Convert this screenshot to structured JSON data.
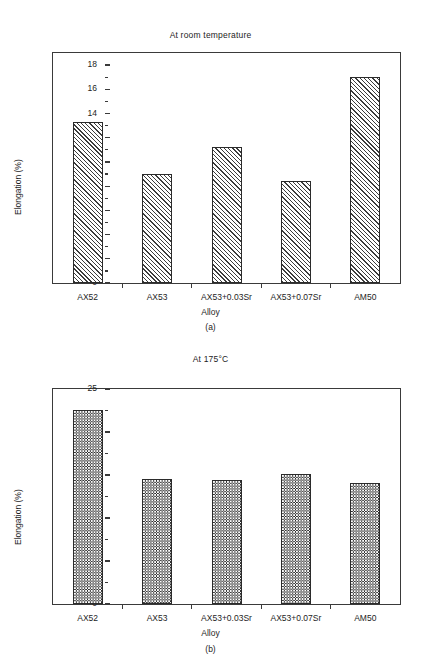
{
  "chart_data": [
    {
      "type": "bar",
      "panel": "(a)",
      "title": "At room temperature",
      "xlabel": "Alloy",
      "ylabel": "Elongation (%)",
      "categories": [
        "AX52",
        "AX53",
        "AX53+0.03Sr",
        "AX53+0.07Sr",
        "AM50"
      ],
      "values": [
        13.3,
        9.0,
        11.2,
        8.4,
        17.0
      ],
      "ylim": [
        0,
        19
      ],
      "ytick_values": [
        0,
        2,
        4,
        6,
        8,
        10,
        12,
        14,
        16,
        18
      ],
      "ytick_labels": [
        "0",
        "2",
        "4",
        "6",
        "8",
        "10",
        "12",
        "14",
        "16",
        "18"
      ],
      "yminor_values": [
        1,
        3,
        5,
        7,
        9,
        11,
        13,
        15,
        17
      ],
      "grid": false,
      "legend": "none",
      "fill_pattern": "diagonal-hatch"
    },
    {
      "type": "bar",
      "panel": "(b)",
      "title": "At 175°C",
      "xlabel": "Alloy",
      "ylabel": "Elongation (%)",
      "categories": [
        "AX52",
        "AX53",
        "AX53+0.03Sr",
        "AX53+0.07Sr",
        "AM50"
      ],
      "values": [
        22.6,
        14.5,
        14.4,
        15.1,
        14.1
      ],
      "ylim": [
        0,
        25
      ],
      "ytick_values": [
        0,
        5,
        10,
        15,
        20,
        25
      ],
      "ytick_labels": [
        "0",
        "5",
        "10",
        "15",
        "20",
        "25"
      ],
      "yminor_values": [
        2.5,
        7.5,
        12.5,
        17.5,
        22.5
      ],
      "grid": false,
      "legend": "none",
      "fill_pattern": "checkerboard"
    }
  ],
  "figure_a": {
    "title": "At room temperature",
    "ylabel": "Elongation (%)",
    "xlabel": "Alloy",
    "panel_label": "(a)",
    "ytick_labels": [
      "0",
      "2",
      "4",
      "6",
      "8",
      "10",
      "12",
      "14",
      "16",
      "18"
    ],
    "xtick_labels": [
      "AX52",
      "AX53",
      "AX53+0.03Sr",
      "AX53+0.07Sr",
      "AM50"
    ]
  },
  "figure_b": {
    "title": "At 175°C",
    "ylabel": "Elongation (%)",
    "xlabel": "Alloy",
    "panel_label": "(b)",
    "ytick_labels": [
      "0",
      "5",
      "10",
      "15",
      "20",
      "25"
    ],
    "xtick_labels": [
      "AX52",
      "AX53",
      "AX53+0.03Sr",
      "AX53+0.07Sr",
      "AM50"
    ]
  },
  "colors": {
    "axis": "#3a3a3a",
    "bar_outline": "#2b2b2b",
    "bar_pattern": "#3c3c3c",
    "text": "#1d1d1d",
    "background": "#ffffff"
  }
}
